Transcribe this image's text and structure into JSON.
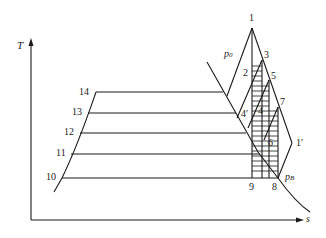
{
  "diagram": {
    "type": "T-s diagram (reheat/regenerative steam cycle)",
    "axes": {
      "y_label": "T",
      "x_label": "s"
    },
    "pressure_labels": {
      "p0": "p",
      "p0_sub": "0",
      "pB": "p",
      "pB_sub": "B"
    },
    "points": {
      "p1": "1",
      "p2": "2",
      "p3": "3",
      "p4": "4",
      "p4prime": "4′",
      "p5": "5",
      "p6": "6",
      "p7": "7",
      "p1prime": "1′",
      "p8": "8",
      "p9": "9",
      "p10": "10",
      "p11": "11",
      "p12": "12",
      "p13": "13",
      "p14": "14"
    },
    "colors": {
      "line": "#1a1a1a",
      "background": "#ffffff"
    }
  }
}
